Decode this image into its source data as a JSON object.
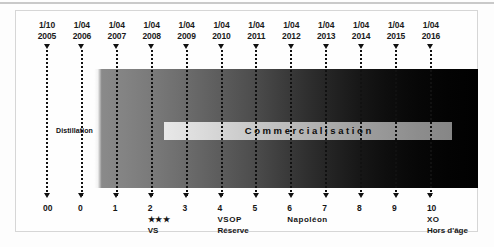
{
  "chart_data": {
    "type": "bar",
    "xlabel": "",
    "ylabel": "",
    "orientation": "horizontal-timeline",
    "grid": true,
    "legend_position": "none",
    "categories": [
      "00",
      "0",
      "1",
      "2",
      "3",
      "4",
      "5",
      "6",
      "7",
      "8",
      "9",
      "10"
    ],
    "x": [
      "1/10 2005",
      "1/04 2006",
      "1/04 2007",
      "1/04 2008",
      "1/04 2009",
      "1/04 2010",
      "1/04 2011",
      "1/04 2012",
      "1/04 2013",
      "1/04 2014",
      "1/04 2015",
      "1/04 2016"
    ],
    "values": [
      0,
      1,
      2,
      3,
      4,
      5,
      6,
      7,
      8,
      9,
      10,
      11
    ],
    "annotations": [
      "Distillation",
      "Commercialisation",
      "*** VS",
      "VSOP Réserve",
      "Napoléon",
      "XO Hors d'âge"
    ],
    "series": [
      {
        "name": "Vieillissement (compte d'âge)",
        "values": [
          0,
          0,
          1,
          2,
          3,
          4,
          5,
          6,
          7,
          8,
          9,
          10
        ]
      }
    ]
  },
  "header": {
    "dates": [
      {
        "day": "1/10",
        "year": "2005"
      },
      {
        "day": "1/04",
        "year": "2006"
      },
      {
        "day": "1/04",
        "year": "2007"
      },
      {
        "day": "1/04",
        "year": "2008"
      },
      {
        "day": "1/04",
        "year": "2009"
      },
      {
        "day": "1/04",
        "year": "2010"
      },
      {
        "day": "1/04",
        "year": "2011"
      },
      {
        "day": "1/04",
        "year": "2012"
      },
      {
        "day": "1/04",
        "year": "2013"
      },
      {
        "day": "1/04",
        "year": "2014"
      },
      {
        "day": "1/04",
        "year": "2015"
      },
      {
        "day": "1/04",
        "year": "2016"
      }
    ]
  },
  "band": {
    "distillation_label": "Distillation",
    "commercialisation_label": "Commercialisation"
  },
  "footer": {
    "ages": [
      {
        "num": "00",
        "stars": "",
        "sub": ""
      },
      {
        "num": "0",
        "stars": "",
        "sub": ""
      },
      {
        "num": "1",
        "stars": "",
        "sub": ""
      },
      {
        "num": "2",
        "stars": "★★★",
        "sub": "VS"
      },
      {
        "num": "3",
        "stars": "",
        "sub": ""
      },
      {
        "num": "4",
        "stars": "VSOP",
        "sub": "Réserve"
      },
      {
        "num": "5",
        "stars": "",
        "sub": ""
      },
      {
        "num": "6",
        "stars": "Napoléon",
        "sub": ""
      },
      {
        "num": "7",
        "stars": "",
        "sub": ""
      },
      {
        "num": "8",
        "stars": "",
        "sub": ""
      },
      {
        "num": "9",
        "stars": "",
        "sub": ""
      },
      {
        "num": "10",
        "stars": "XO",
        "sub": "Hors d'âge"
      }
    ]
  },
  "colors": {
    "ink": "#111111",
    "page": "#fdfdfd",
    "frame": "#d6d6d6",
    "band_start": "#ffffff",
    "band_end": "#010101",
    "commercialisation_start": "#e8e8e8",
    "commercialisation_end": "#868686"
  }
}
